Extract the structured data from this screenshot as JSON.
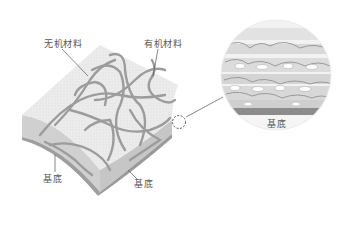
{
  "labels": {
    "inorganic": "无机材料",
    "organic": "有机材料",
    "substrate_left": "基底",
    "substrate_bottom": "基底",
    "substrate_zoom": "基底"
  },
  "colors": {
    "surface": "#e6e6e6",
    "side": "#d2d2d2",
    "fiber": "#9a9a9a",
    "substrate": "#8a8a8a",
    "leader": "#555555"
  }
}
